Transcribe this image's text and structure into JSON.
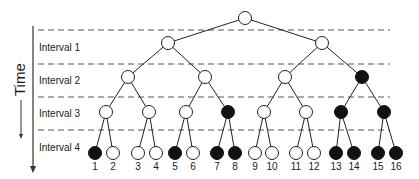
{
  "diagram": {
    "type": "binary-tree-time-intervals",
    "time_axis": {
      "label": "Time",
      "direction": "down"
    },
    "intervals": [
      {
        "label": "Interval 1",
        "y": 47
      },
      {
        "label": "Interval 2",
        "y": 80
      },
      {
        "label": "Interval 3",
        "y": 113
      },
      {
        "label": "Interval 4",
        "y": 147
      }
    ],
    "dashed_lines_y": [
      30,
      64,
      97,
      130
    ],
    "colors": {
      "filled": "#111111",
      "open": "#ffffff",
      "stroke": "#222222"
    },
    "nodes": [
      {
        "id": "r",
        "x": 245,
        "y": 18,
        "filled": false
      },
      {
        "id": "a",
        "x": 168,
        "y": 43,
        "filled": false
      },
      {
        "id": "b",
        "x": 322,
        "y": 43,
        "filled": false
      },
      {
        "id": "a1",
        "x": 128,
        "y": 77,
        "filled": false
      },
      {
        "id": "a2",
        "x": 205,
        "y": 77,
        "filled": false
      },
      {
        "id": "b1",
        "x": 285,
        "y": 77,
        "filled": false
      },
      {
        "id": "b2",
        "x": 362,
        "y": 77,
        "filled": true
      },
      {
        "id": "a11",
        "x": 106,
        "y": 112,
        "filled": false
      },
      {
        "id": "a12",
        "x": 149,
        "y": 112,
        "filled": false
      },
      {
        "id": "a21",
        "x": 186,
        "y": 112,
        "filled": false
      },
      {
        "id": "a22",
        "x": 228,
        "y": 112,
        "filled": true
      },
      {
        "id": "b11",
        "x": 264,
        "y": 112,
        "filled": false
      },
      {
        "id": "b12",
        "x": 306,
        "y": 112,
        "filled": false
      },
      {
        "id": "b21",
        "x": 341,
        "y": 112,
        "filled": true
      },
      {
        "id": "b22",
        "x": 384,
        "y": 112,
        "filled": true
      }
    ],
    "leaves": [
      {
        "label": "1",
        "x": 95,
        "filled": true,
        "parent": "a11"
      },
      {
        "label": "2",
        "x": 113,
        "filled": false,
        "parent": "a11"
      },
      {
        "label": "3",
        "x": 138,
        "filled": false,
        "parent": "a12"
      },
      {
        "label": "4",
        "x": 156,
        "filled": false,
        "parent": "a12"
      },
      {
        "label": "5",
        "x": 175,
        "filled": true,
        "parent": "a21"
      },
      {
        "label": "6",
        "x": 193,
        "filled": false,
        "parent": "a21"
      },
      {
        "label": "7",
        "x": 217,
        "filled": true,
        "parent": "a22"
      },
      {
        "label": "8",
        "x": 235,
        "filled": true,
        "parent": "a22"
      },
      {
        "label": "9",
        "x": 255,
        "filled": false,
        "parent": "b11"
      },
      {
        "label": "10",
        "x": 272,
        "filled": false,
        "parent": "b11"
      },
      {
        "label": "11",
        "x": 296,
        "filled": false,
        "parent": "b12"
      },
      {
        "label": "12",
        "x": 314,
        "filled": false,
        "parent": "b12"
      },
      {
        "label": "13",
        "x": 336,
        "filled": true,
        "parent": "b21"
      },
      {
        "label": "14",
        "x": 354,
        "filled": true,
        "parent": "b21"
      },
      {
        "label": "15",
        "x": 378,
        "filled": true,
        "parent": "b22"
      },
      {
        "label": "16",
        "x": 396,
        "filled": true,
        "parent": "b22"
      }
    ],
    "edges": [
      [
        "r",
        "a"
      ],
      [
        "r",
        "b"
      ],
      [
        "a",
        "a1"
      ],
      [
        "a",
        "a2"
      ],
      [
        "b",
        "b1"
      ],
      [
        "b",
        "b2"
      ],
      [
        "a1",
        "a11"
      ],
      [
        "a1",
        "a12"
      ],
      [
        "a2",
        "a21"
      ],
      [
        "a2",
        "a22"
      ],
      [
        "b1",
        "b11"
      ],
      [
        "b1",
        "b12"
      ],
      [
        "b2",
        "b21"
      ],
      [
        "b2",
        "b22"
      ]
    ],
    "leaf_y": 153,
    "leaf_label_y": 170,
    "node_radius": 6.5
  }
}
